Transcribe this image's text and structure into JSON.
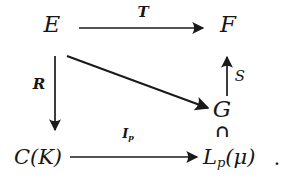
{
  "diagram": {
    "type": "commutative-diagram",
    "background_color": "#ffffff",
    "ink_color": "#1a1a1a",
    "nodes": {
      "E": {
        "label": "E"
      },
      "F": {
        "label": "F"
      },
      "G": {
        "label": "G"
      },
      "CK": {
        "label": "C(K)"
      },
      "Lp": {
        "base": "L",
        "sub": "p",
        "args": "(μ)"
      },
      "inclusion": {
        "symbol": "∩"
      },
      "period": {
        "label": "."
      }
    },
    "arrows": {
      "T": {
        "label": "T",
        "from": "E",
        "to": "F"
      },
      "R": {
        "label": "R",
        "from": "E",
        "to": "CK"
      },
      "S": {
        "label": "S",
        "from": "G",
        "to": "F"
      },
      "Ip": {
        "base": "I",
        "sub": "p",
        "from": "CK",
        "to": "Lp"
      },
      "diagonal": {
        "label": "",
        "from": "E",
        "to": "G"
      }
    }
  }
}
